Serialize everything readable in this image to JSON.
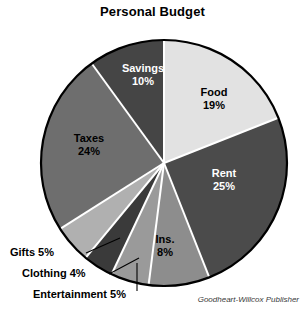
{
  "chart_data": {
    "type": "pie",
    "title": "Personal Budget",
    "credit": "Goodheart-Willcox Publisher",
    "unit": "%",
    "total": 100,
    "legend": "none",
    "labels": [
      "Food",
      "Rent",
      "Ins.",
      "Entertainment",
      "Clothing",
      "Gifts",
      "Taxes",
      "Savings"
    ],
    "values": [
      19,
      25,
      8,
      5,
      4,
      5,
      24,
      10
    ],
    "colors": [
      "#e2e2e2",
      "#4b4b4b",
      "#8d8d8d",
      "#9a9a9a",
      "#3a3a3a",
      "#b0b0b0",
      "#6e6e6e",
      "#454545"
    ],
    "slices": [
      {
        "name": "Food",
        "value": 19,
        "value_text": "19%",
        "color": "#e2e2e2",
        "label_placement": "inside",
        "text_color": "#000000"
      },
      {
        "name": "Rent",
        "value": 25,
        "value_text": "25%",
        "color": "#4b4b4b",
        "label_placement": "inside",
        "text_color": "#ffffff"
      },
      {
        "name": "Ins.",
        "value": 8,
        "value_text": "8%",
        "color": "#8d8d8d",
        "label_placement": "inside",
        "text_color": "#000000"
      },
      {
        "name": "Entertainment",
        "value": 5,
        "value_text": "5%",
        "color": "#9a9a9a",
        "label_placement": "callout",
        "text_color": "#000000"
      },
      {
        "name": "Clothing",
        "value": 4,
        "value_text": "4%",
        "color": "#3a3a3a",
        "label_placement": "callout",
        "text_color": "#000000"
      },
      {
        "name": "Gifts",
        "value": 5,
        "value_text": "5%",
        "color": "#b0b0b0",
        "label_placement": "callout",
        "text_color": "#000000"
      },
      {
        "name": "Taxes",
        "value": 24,
        "value_text": "24%",
        "color": "#6e6e6e",
        "label_placement": "inside",
        "text_color": "#000000"
      },
      {
        "name": "Savings",
        "value": 10,
        "value_text": "10%",
        "color": "#454545",
        "label_placement": "inside",
        "text_color": "#ffffff"
      }
    ],
    "start_angle_deg": 0,
    "direction": "clockwise",
    "divider_color": "#ffffff",
    "outline_color": "#000000"
  },
  "inside_labels": {
    "food": {
      "name": "Food",
      "pct": "19%"
    },
    "rent": {
      "name": "Rent",
      "pct": "25%"
    },
    "ins": {
      "name": "Ins.",
      "pct": "8%"
    },
    "taxes": {
      "name": "Taxes",
      "pct": "24%"
    },
    "savings": {
      "name": "Savings",
      "pct": "10%"
    }
  },
  "callouts": {
    "gifts": "Gifts 5%",
    "clothing": "Clothing 4%",
    "entertainment": "Entertainment 5%"
  }
}
